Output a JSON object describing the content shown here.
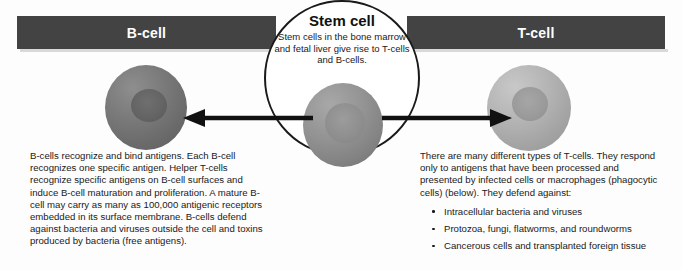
{
  "diagram": {
    "title_left": "B-cell",
    "title_right": "T-cell",
    "colors": {
      "header_bar": "#434343",
      "header_text": "#ffffff",
      "body_text": "#1a1a1a",
      "background": "#fdfdfd",
      "circle_outline": "#1a1a1a",
      "arrow": "#111111"
    },
    "stem_cell": {
      "title": "Stem cell",
      "description": "Stem cells in the bone marrow and fetal liver give rise to T-cells and B-cells."
    },
    "left_panel": {
      "label": "B-cell",
      "paragraph": "B-cells recognize and bind antigens. Each B-cell recognizes one specific antigen. Helper T-cells recognize specific antigens on B-cell surfaces and induce B-cell maturation and proliferation. A mature B-cell may carry as many as 100,000 antigenic receptors embedded in its surface membrane. B-cells defend against bacteria and viruses outside the cell and toxins produced by bacteria (free antigens)."
    },
    "right_panel": {
      "label": "T-cell",
      "paragraph": "There are many different types of T-cells. They respond only to antigens that have been processed and presented by infected cells or macrophages (phagocytic cells) (below). They defend against:",
      "bullets": [
        "Intracellular bacteria and viruses",
        "Protozoa, fungi, flatworms, and roundworms",
        "Cancerous cells and transplanted foreign tissue"
      ]
    },
    "arrows": {
      "left": "arrow-left",
      "right": "arrow-right"
    }
  }
}
